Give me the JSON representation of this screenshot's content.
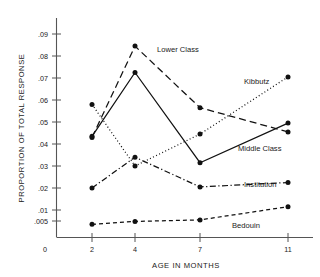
{
  "chart_data": {
    "type": "line",
    "title": "",
    "xlabel": "AGE IN MONTHS",
    "ylabel": "PROPORTION OF TOTAL RESPONSE",
    "x": [
      2,
      4,
      7,
      11
    ],
    "xticklabels": [
      "0",
      "2",
      "4",
      "7",
      "11"
    ],
    "yticklabels": [
      ".09",
      ".08",
      ".07",
      ".06",
      ".05",
      ".04",
      ".03",
      ".02",
      ".01",
      ".005"
    ],
    "ytickvalues": [
      0.09,
      0.08,
      0.07,
      0.06,
      0.05,
      0.04,
      0.03,
      0.02,
      0.01,
      0.005
    ],
    "ylim": [
      0,
      0.095
    ],
    "grid": false,
    "legend_position": "inline-annotations",
    "series": [
      {
        "name": "Lower Class",
        "style": "long-dash",
        "values": [
          0.043,
          0.0845,
          0.0565,
          0.0455
        ]
      },
      {
        "name": "Middle Class",
        "style": "solid",
        "values": [
          0.0435,
          0.0725,
          0.0315,
          0.0495
        ]
      },
      {
        "name": "Kibbutz",
        "style": "dotted",
        "values": [
          0.058,
          0.03,
          0.0445,
          0.0705
        ]
      },
      {
        "name": "Institution",
        "style": "dash-dot",
        "values": [
          0.02,
          0.034,
          0.0205,
          0.0225
        ]
      },
      {
        "name": "Bedouin",
        "style": "short-dash",
        "values": [
          0.0035,
          0.0048,
          0.0055,
          0.0115
        ]
      }
    ]
  }
}
